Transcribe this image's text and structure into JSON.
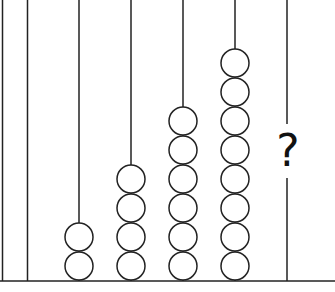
{
  "diagram": {
    "type": "abacus-sequence",
    "rods": [
      {
        "label": "rod-1",
        "beads": 2
      },
      {
        "label": "rod-2",
        "beads": 4
      },
      {
        "label": "rod-3",
        "beads": 6
      },
      {
        "label": "rod-4",
        "beads": 8
      },
      {
        "label": "rod-5",
        "beads": null,
        "unknown_marker": "?"
      }
    ],
    "sequence": [
      2,
      4,
      6,
      8,
      "?"
    ],
    "colors": {
      "stroke": "#222222",
      "background": "#ffffff"
    }
  }
}
